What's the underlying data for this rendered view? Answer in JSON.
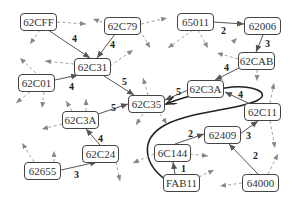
{
  "diagram": {
    "type": "directed-graph",
    "nodes": [
      {
        "id": "n_62CFF",
        "label": "62CFF",
        "x": 20,
        "y": 13
      },
      {
        "id": "n_62C79",
        "label": "62C79",
        "x": 104,
        "y": 17
      },
      {
        "id": "n_65011",
        "label": "65011",
        "x": 177,
        "y": 13
      },
      {
        "id": "n_62006",
        "label": "62006",
        "x": 244,
        "y": 17
      },
      {
        "id": "n_62C31",
        "label": "62C31",
        "x": 74,
        "y": 58
      },
      {
        "id": "n_62CAB",
        "label": "62CAB",
        "x": 238,
        "y": 52
      },
      {
        "id": "n_62C01",
        "label": "62C01",
        "x": 18,
        "y": 74
      },
      {
        "id": "n_62C3A_r",
        "label": "62C3A",
        "x": 187,
        "y": 80
      },
      {
        "id": "n_62C35",
        "label": "62C35",
        "x": 128,
        "y": 95
      },
      {
        "id": "n_62C11",
        "label": "62C11",
        "x": 244,
        "y": 103
      },
      {
        "id": "n_62C3A_l",
        "label": "62C3A",
        "x": 62,
        "y": 111
      },
      {
        "id": "n_62409",
        "label": "62409",
        "x": 204,
        "y": 126
      },
      {
        "id": "n_6C144",
        "label": "6C144",
        "x": 154,
        "y": 144
      },
      {
        "id": "n_62C24",
        "label": "62C24",
        "x": 82,
        "y": 145
      },
      {
        "id": "n_62655",
        "label": "62655",
        "x": 24,
        "y": 162
      },
      {
        "id": "n_FAB11",
        "label": "FAB11",
        "x": 163,
        "y": 174
      },
      {
        "id": "n_64000",
        "label": "64000",
        "x": 242,
        "y": 174
      }
    ],
    "edges": [
      {
        "from": "62CFF",
        "to": "62C31",
        "weight": "4",
        "lx": 72,
        "ly": 34
      },
      {
        "from": "62C79",
        "to": "62C31",
        "weight": "4",
        "lx": 108,
        "ly": 39
      },
      {
        "from": "62C01",
        "to": "62C31",
        "weight": "4",
        "lx": 69,
        "ly": 82
      },
      {
        "from": "62C31",
        "to": "62C35",
        "weight": "5",
        "lx": 120,
        "ly": 77
      },
      {
        "from": "62C3A",
        "to": "62C35",
        "weight": "5",
        "lx": 111,
        "ly": 105
      },
      {
        "from": "62C3A",
        "to": "62C35",
        "weight": "5",
        "lx": 175,
        "ly": 89
      },
      {
        "from": "62C24",
        "to": "62C3A",
        "weight": "4",
        "lx": 98,
        "ly": 134
      },
      {
        "from": "62655",
        "to": "62C24",
        "weight": "3",
        "lx": 74,
        "ly": 171
      },
      {
        "from": "65011",
        "to": "62006",
        "weight": "2",
        "lx": 221,
        "ly": 26
      },
      {
        "from": "62006",
        "to": "62CAB",
        "weight": "3",
        "lx": 264,
        "ly": 38
      },
      {
        "from": "62CAB",
        "to": "62C3A",
        "weight": "4",
        "lx": 224,
        "ly": 63
      },
      {
        "from": "62C11",
        "to": "62C3A",
        "weight": "4",
        "lx": 238,
        "ly": 91
      },
      {
        "from": "62409",
        "to": "62C11",
        "weight": "3",
        "lx": 246,
        "ly": 131
      },
      {
        "from": "64000",
        "to": "62409",
        "weight": "2",
        "lx": 252,
        "ly": 151
      },
      {
        "from": "6C144",
        "to": "62409",
        "weight": "2",
        "lx": 188,
        "ly": 130
      },
      {
        "from": "FAB11",
        "to": "6C144",
        "weight": "1",
        "lx": 179,
        "ly": 165
      },
      {
        "from": "FAB11",
        "to": "62C35",
        "weight": "",
        "path": "curved",
        "lx": 0,
        "ly": 0
      }
    ]
  }
}
